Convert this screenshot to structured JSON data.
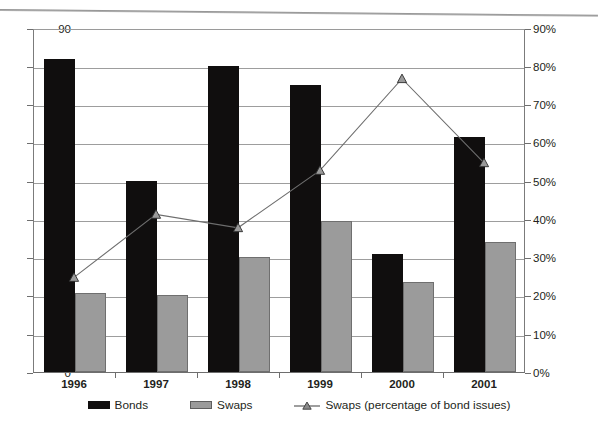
{
  "chart_data": {
    "type": "bar",
    "title": "",
    "subtitle": "",
    "xlabel": "",
    "ylabel": "",
    "categories": [
      "1996",
      "1997",
      "1998",
      "1999",
      "2000",
      "2001"
    ],
    "series": [
      {
        "name": "Bonds",
        "type": "bar",
        "axis": "left",
        "color": "#100e0e",
        "values": [
          82,
          50,
          80,
          75,
          31,
          61.5
        ]
      },
      {
        "name": "Swaps",
        "type": "bar",
        "axis": "left",
        "color": "#9b9b9b",
        "values": [
          20.7,
          20.2,
          30,
          39.5,
          23.5,
          34
        ]
      },
      {
        "name": "Swaps (percentage of bond issues)",
        "type": "line",
        "axis": "right",
        "color": "#6e6e6e",
        "marker": "triangle",
        "values": [
          25,
          41.5,
          38,
          53,
          77,
          55
        ]
      }
    ],
    "yaxis_left": {
      "min": 0,
      "max": 90,
      "step": 10,
      "ticks": [
        "0",
        "10",
        "20",
        "30",
        "40",
        "50",
        "60",
        "70",
        "80",
        "90"
      ]
    },
    "yaxis_right": {
      "min": 0,
      "max": 90,
      "step": 10,
      "ticks": [
        "0%",
        "10%",
        "20%",
        "30%",
        "40%",
        "50%",
        "60%",
        "70%",
        "80%",
        "90%"
      ]
    },
    "grid": true,
    "legend_position": "bottom",
    "legend": [
      {
        "label": "Bonds",
        "marker": "filled-square",
        "color": "#100e0e"
      },
      {
        "label": "Swaps",
        "marker": "filled-square",
        "color": "#9b9b9b"
      },
      {
        "label": "Swaps (percentage of bond issues)",
        "marker": "triangle-line",
        "color": "#6e6e6e"
      }
    ]
  }
}
